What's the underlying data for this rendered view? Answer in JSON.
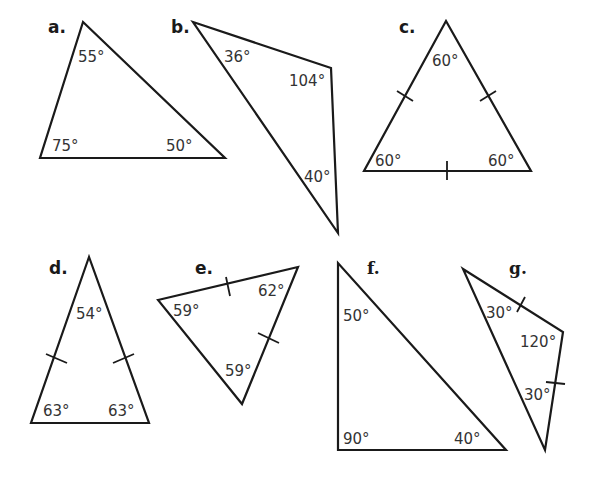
{
  "diagram": {
    "stroke_color": "#1a1a1a",
    "text_color": "#333333",
    "triangles": [
      {
        "label": "a.",
        "angles": [
          "55°",
          "75°",
          "50°"
        ],
        "tick_marks": 0
      },
      {
        "label": "b.",
        "angles": [
          "36°",
          "104°",
          "40°"
        ],
        "tick_marks": 0
      },
      {
        "label": "c.",
        "angles": [
          "60°",
          "60°",
          "60°"
        ],
        "tick_marks": 3
      },
      {
        "label": "d.",
        "angles": [
          "54°",
          "63°",
          "63°"
        ],
        "tick_marks": 2
      },
      {
        "label": "e.",
        "angles": [
          "59°",
          "62°",
          "59°"
        ],
        "tick_marks": 2
      },
      {
        "label": "f.",
        "angles": [
          "50°",
          "90°",
          "40°"
        ],
        "tick_marks": 0
      },
      {
        "label": "g.",
        "angles": [
          "30°",
          "120°",
          "30°"
        ],
        "tick_marks": 2
      }
    ]
  }
}
